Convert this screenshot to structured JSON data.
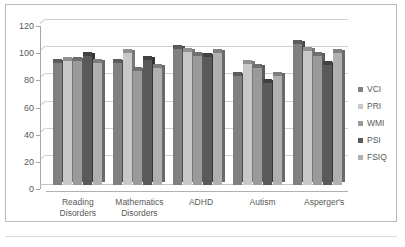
{
  "chart_data": {
    "type": "bar",
    "title": "",
    "subtitle": "",
    "xlabel": "",
    "ylabel": "",
    "ylim": [
      0,
      120
    ],
    "ytick_step": 20,
    "yticks": [
      0,
      20,
      40,
      60,
      80,
      100,
      120
    ],
    "grid": "horizontal",
    "legend_position": "right",
    "style": "3d-clustered-column",
    "categories": [
      "Reading Disorders",
      "Mathematics Disorders",
      "ADHD",
      "Autism",
      "Asperger's"
    ],
    "category_lines": [
      [
        "Reading",
        "Disorders"
      ],
      [
        "Mathematics",
        "Disorders"
      ],
      [
        "ADHD"
      ],
      [
        "Autism"
      ],
      [
        "Asperger's"
      ]
    ],
    "series": [
      {
        "name": "VCI",
        "color": "#808080",
        "values": [
          90,
          90,
          100,
          80,
          104
        ]
      },
      {
        "name": "PRI",
        "color": "#c8c8c8",
        "values": [
          91,
          97,
          98,
          89,
          99
        ]
      },
      {
        "name": "WMI",
        "color": "#9a9a9a",
        "values": [
          91,
          84,
          95,
          86,
          95
        ]
      },
      {
        "name": "PSI",
        "color": "#5a5a5a",
        "values": [
          95,
          92,
          94,
          75,
          88
        ]
      },
      {
        "name": "FSIQ",
        "color": "#b0b0b0",
        "values": [
          90,
          86,
          97,
          80,
          97
        ]
      }
    ]
  },
  "colors": {
    "frame_border": "#b9b9b9",
    "gridline": "#d6d6d6",
    "axis": "#a6a6a6",
    "text": "#595959",
    "background": "#ffffff"
  }
}
